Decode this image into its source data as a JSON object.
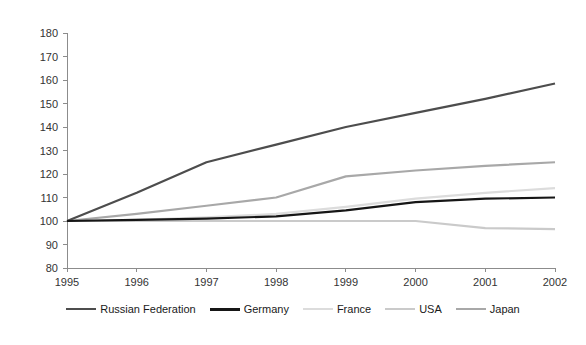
{
  "chart_data": {
    "type": "line",
    "title": "",
    "subtitle": "",
    "xlabel": "",
    "ylabel": "",
    "x": [
      1995,
      1996,
      1997,
      1998,
      1999,
      2000,
      2001,
      2002
    ],
    "categories": [
      "1995",
      "1996",
      "1997",
      "1998",
      "1999",
      "2000",
      "2001",
      "2002"
    ],
    "xlim": [
      1995,
      2002
    ],
    "ylim": [
      80,
      180
    ],
    "y_ticks": [
      80,
      90,
      100,
      110,
      120,
      130,
      140,
      150,
      160,
      170,
      180
    ],
    "y_tick_labels": [
      "80",
      "90",
      "100",
      "110",
      "120",
      "130",
      "140",
      "150",
      "160",
      "170",
      "180"
    ],
    "grid": false,
    "legend_position": "bottom",
    "series": [
      {
        "name": "Russian Federation",
        "color": "#4d4d4d",
        "width": 2.2,
        "values": [
          100,
          112,
          125,
          132.5,
          140,
          146,
          152,
          158.5
        ]
      },
      {
        "name": "Germany",
        "color": "#161616",
        "width": 2.2,
        "values": [
          100,
          100.5,
          101,
          102,
          104.5,
          108,
          109.5,
          110
        ]
      },
      {
        "name": "France",
        "color": "#dcdcdc",
        "width": 2.2,
        "values": [
          100,
          100.5,
          101.5,
          103,
          106,
          109.5,
          112,
          114
        ]
      },
      {
        "name": "USA",
        "color": "#cacaca",
        "width": 2.2,
        "values": [
          100,
          100,
          100,
          100,
          100,
          100,
          97,
          96.5
        ]
      },
      {
        "name": "Japan",
        "color": "#a8a8a8",
        "width": 2.2,
        "values": [
          100,
          103,
          106.5,
          110,
          119,
          121.5,
          123.5,
          125
        ]
      }
    ]
  },
  "axis": {
    "axis_color": "#8c8c8c",
    "tick_text_color": "#333333"
  },
  "legend": {
    "entries": [
      {
        "label": "Russian Federation",
        "color": "#4d4d4d",
        "width": 2.6
      },
      {
        "label": "Germany",
        "color": "#161616",
        "width": 3.2
      },
      {
        "label": "France",
        "color": "#dcdcdc",
        "width": 2.6
      },
      {
        "label": "USA",
        "color": "#cacaca",
        "width": 2.6
      },
      {
        "label": "Japan",
        "color": "#a8a8a8",
        "width": 2.6
      }
    ]
  }
}
